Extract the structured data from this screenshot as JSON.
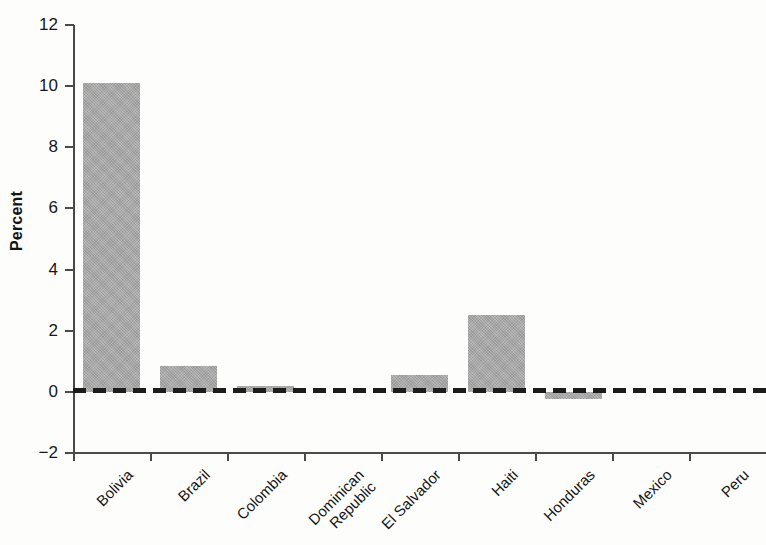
{
  "chart_data": {
    "type": "bar",
    "title": "",
    "subtitle": "",
    "xlabel": "",
    "ylabel": "Percent",
    "ylim": [
      -2,
      12
    ],
    "y_ticks": [
      12,
      10,
      8,
      6,
      4,
      2,
      0,
      -2
    ],
    "y_tick_labels": [
      "12",
      "10",
      "8",
      "6",
      "4",
      "2",
      "0",
      "−2"
    ],
    "grid": false,
    "legend": null,
    "zero_line": true,
    "zero_line_style": "dashed",
    "bar_color": "#a9a9a9",
    "axis_color": "#4a4a4a",
    "categories": [
      "Bolivia",
      "Brazil",
      "Colombia",
      "Dominican Republic",
      "El Salvador",
      "Haiti",
      "Honduras",
      "Mexico",
      "Peru"
    ],
    "category_lines": [
      [
        "Bolivia"
      ],
      [
        "Brazil"
      ],
      [
        "Colombia"
      ],
      [
        "Dominican",
        "Republic"
      ],
      [
        "El Salvador"
      ],
      [
        "Haiti"
      ],
      [
        "Honduras"
      ],
      [
        "Mexico"
      ],
      [
        "Peru"
      ]
    ],
    "values": [
      10.1,
      0.85,
      0.2,
      0.0,
      0.55,
      2.5,
      -0.25,
      0.0,
      0.0
    ]
  }
}
